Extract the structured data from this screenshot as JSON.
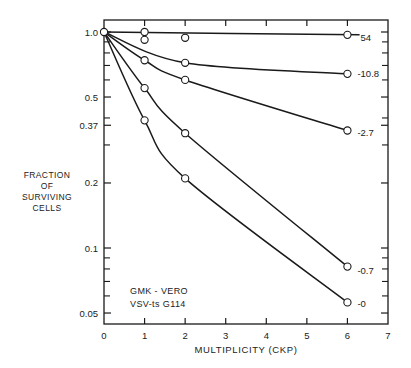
{
  "chart_data": {
    "type": "line",
    "title": "",
    "xlabel": "MULTIPLICITY (CKP)",
    "ylabel": "FRACTION OF SURVIVING CELLS",
    "ylabel_lines": [
      "FRACTION",
      "OF",
      "SURVIVING",
      "CELLS"
    ],
    "xscale": "linear",
    "yscale": "log",
    "xlim": [
      0,
      7
    ],
    "ylim": [
      0.045,
      1.05
    ],
    "x_ticks": [
      0,
      1,
      2,
      3,
      4,
      5,
      6,
      7
    ],
    "x_tick_labels": [
      "0",
      "1",
      "2",
      "3",
      "4",
      "5",
      "6",
      "7"
    ],
    "y_ticks": [
      1.0,
      0.5,
      0.37,
      0.2,
      0.1,
      0.05
    ],
    "y_tick_labels": [
      "1.0",
      "0.5",
      "0.37",
      "0.2",
      "0.1",
      "0.05"
    ],
    "grid": false,
    "annotation": [
      "GMK - VERO",
      "VSV-ts G114"
    ],
    "series": [
      {
        "name": "54",
        "x": [
          0,
          1,
          1,
          2,
          6
        ],
        "y": [
          1.0,
          1.0,
          0.92,
          0.94,
          0.97
        ]
      },
      {
        "name": "10.8",
        "x": [
          0,
          2,
          6
        ],
        "y": [
          1.0,
          0.72,
          0.64
        ]
      },
      {
        "name": "2.7",
        "x": [
          0,
          1,
          2,
          6
        ],
        "y": [
          1.0,
          0.74,
          0.6,
          0.35
        ]
      },
      {
        "name": "0.7",
        "x": [
          0,
          1,
          2,
          6
        ],
        "y": [
          1.0,
          0.55,
          0.34,
          0.082
        ]
      },
      {
        "name": "0",
        "x": [
          0,
          1,
          2,
          6
        ],
        "y": [
          1.0,
          0.39,
          0.21,
          0.056
        ]
      }
    ],
    "series_label_position": "right end of each curve"
  }
}
